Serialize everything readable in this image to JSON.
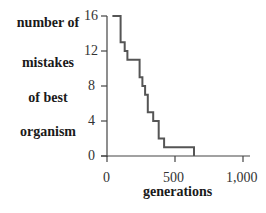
{
  "chart_data": {
    "type": "line",
    "step": true,
    "title": "",
    "xlabel": "generations",
    "ylabel": "number of mistakes of best organism",
    "ylabel_lines": [
      "number of",
      "mistakes",
      "of best",
      "organism"
    ],
    "xlim": [
      0,
      1000
    ],
    "ylim": [
      0,
      16
    ],
    "x_ticks": [
      "0",
      "500",
      "1,000"
    ],
    "y_ticks": [
      "0",
      "4",
      "8",
      "12",
      "16"
    ],
    "grid": false,
    "series": [
      {
        "name": "best organism mistakes",
        "color": "#555555",
        "x": [
          40,
          100,
          100,
          130,
          130,
          150,
          150,
          240,
          240,
          260,
          260,
          280,
          280,
          300,
          300,
          340,
          340,
          380,
          380,
          420,
          420,
          640,
          640
        ],
        "y": [
          16,
          16,
          13,
          13,
          12,
          12,
          11,
          11,
          9,
          9,
          8,
          8,
          7,
          7,
          5,
          5,
          4,
          4,
          2,
          2,
          1,
          1,
          0
        ]
      }
    ]
  }
}
